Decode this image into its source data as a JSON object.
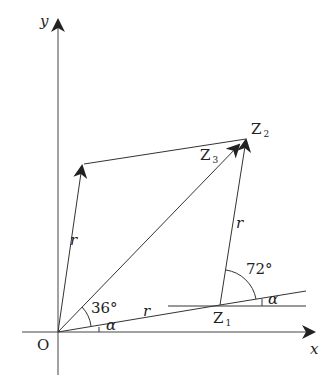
{
  "diagram": {
    "type": "complex-plane-vector-diagram",
    "axes": {
      "x_label": "x",
      "y_label": "y",
      "origin_label": "O"
    },
    "points": {
      "Z1": {
        "label": "Z",
        "sub": "1"
      },
      "Z2": {
        "label": "Z",
        "sub": "2"
      },
      "Z3": {
        "label": "Z",
        "sub": "3"
      }
    },
    "segment_labels": {
      "OZ1": "r",
      "Z1Z2": "r",
      "left_vector": "r"
    },
    "angles": {
      "at_origin_between": "36°",
      "at_origin_base": "α",
      "at_Z1_between": "72°",
      "at_Z1_base": "α"
    },
    "colors": {
      "stroke": "#333333",
      "text": "#222222",
      "background": "#ffffff"
    }
  }
}
